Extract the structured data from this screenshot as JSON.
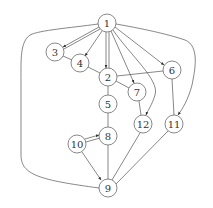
{
  "diagram": {
    "type": "directed-graph",
    "nodes": [
      {
        "id": "1",
        "label": "1",
        "x": 107,
        "y": 23
      },
      {
        "id": "3",
        "label": "3",
        "x": 55,
        "y": 52
      },
      {
        "id": "4",
        "label": "4",
        "x": 80,
        "y": 63
      },
      {
        "id": "2",
        "label": "2",
        "x": 108,
        "y": 77
      },
      {
        "id": "6",
        "label": "6",
        "x": 172,
        "y": 70
      },
      {
        "id": "7",
        "label": "7",
        "x": 137,
        "y": 92
      },
      {
        "id": "5",
        "label": "5",
        "x": 108,
        "y": 104
      },
      {
        "id": "12",
        "label": "12",
        "x": 143,
        "y": 124
      },
      {
        "id": "11",
        "label": "11",
        "x": 174,
        "y": 124
      },
      {
        "id": "8",
        "label": "8",
        "x": 108,
        "y": 136
      },
      {
        "id": "10",
        "label": "10",
        "x": 77,
        "y": 144
      },
      {
        "id": "9",
        "label": "9",
        "x": 108,
        "y": 188
      }
    ],
    "edges": [
      {
        "from": "1",
        "to": "3",
        "directed": true
      },
      {
        "from": "1",
        "to": "3",
        "directed": true
      },
      {
        "from": "1",
        "to": "4",
        "directed": true
      },
      {
        "from": "1",
        "to": "2",
        "directed": true
      },
      {
        "from": "1",
        "to": "2",
        "directed": true
      },
      {
        "from": "1",
        "to": "7",
        "directed": true
      },
      {
        "from": "1",
        "to": "12",
        "directed": true
      },
      {
        "from": "1",
        "to": "6",
        "directed": true
      },
      {
        "from": "1",
        "to": "11",
        "directed": true
      },
      {
        "from": "1",
        "to": "9",
        "directed": false
      },
      {
        "from": "3",
        "to": "4",
        "directed": false
      },
      {
        "from": "4",
        "to": "2",
        "directed": false
      },
      {
        "from": "2",
        "to": "6",
        "directed": false
      },
      {
        "from": "2",
        "to": "7",
        "directed": false
      },
      {
        "from": "2",
        "to": "5",
        "directed": false
      },
      {
        "from": "6",
        "to": "11",
        "directed": false
      },
      {
        "from": "7",
        "to": "12",
        "directed": false
      },
      {
        "from": "5",
        "to": "8",
        "directed": false
      },
      {
        "from": "10",
        "to": "8",
        "directed": true
      },
      {
        "from": "10",
        "to": "8",
        "directed": false
      },
      {
        "from": "10",
        "to": "9",
        "directed": true
      },
      {
        "from": "8",
        "to": "9",
        "directed": false
      },
      {
        "from": "12",
        "to": "9",
        "directed": false
      },
      {
        "from": "11",
        "to": "9",
        "directed": false
      }
    ]
  }
}
